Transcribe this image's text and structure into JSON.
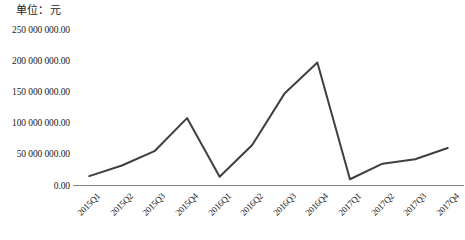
{
  "chart_data": {
    "type": "line",
    "title": "",
    "unit_label": "单位：元",
    "xlabel": "",
    "ylabel": "",
    "categories": [
      "2015Q1",
      "2015Q2",
      "2015Q3",
      "2015Q4",
      "2016Q1",
      "2016Q2",
      "2016Q3",
      "2016Q4",
      "2017Q1",
      "2017Q2",
      "2017Q3",
      "2017Q4"
    ],
    "values": [
      15000000,
      32000000,
      55000000,
      108000000,
      14000000,
      65000000,
      148000000,
      197000000,
      10000000,
      35000000,
      42000000,
      60000000
    ],
    "series": [
      {
        "name": "",
        "values": [
          15000000,
          32000000,
          55000000,
          108000000,
          14000000,
          65000000,
          148000000,
          197000000,
          10000000,
          35000000,
          42000000,
          60000000
        ]
      }
    ],
    "ytick_labels": [
      "0.00",
      "50 000 000.00",
      "100 000 000.00",
      "150 000 000.00",
      "200 000 000.00",
      "250 000 000.00"
    ],
    "ytick_values": [
      0,
      50000000,
      100000000,
      150000000,
      200000000,
      250000000
    ],
    "ylim": [
      0,
      250000000
    ],
    "grid": false,
    "legend": false,
    "line_color": "#3f3f3f",
    "axis_color": "#808080"
  }
}
